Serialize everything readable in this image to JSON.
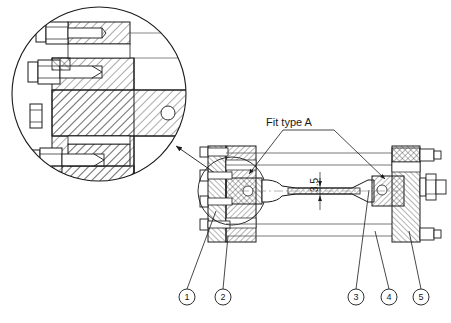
{
  "drawing": {
    "title": "Tensile test specimen assembly with clamping flanges — sectional view",
    "background_color": "#ffffff",
    "line_color": "#1a1a1a",
    "hatch_color": "#333333",
    "thin_line_color": "#555555"
  },
  "annotations": {
    "fit_note": "Fit type A",
    "dimension_thickness": "3.5"
  },
  "detail_view": {
    "name": "enlarged-detail-circle",
    "description": "Enlarged sectional detail of left clamping flange, bolts and specimen grip",
    "circle": {
      "cx": 99,
      "cy": 94,
      "r": 88
    },
    "pointer_target": {
      "x": 222,
      "y": 178
    }
  },
  "balloons": [
    {
      "id": "1",
      "cx": 187,
      "cy": 297,
      "r": 8,
      "leader_to": {
        "x": 216,
        "y": 211
      }
    },
    {
      "id": "2",
      "cx": 223,
      "cy": 297,
      "r": 8,
      "leader_to": {
        "x": 228,
        "y": 236
      }
    },
    {
      "id": "3",
      "cx": 356,
      "cy": 297,
      "r": 8,
      "leader_to": {
        "x": 369,
        "y": 190
      }
    },
    {
      "id": "4",
      "cx": 389,
      "cy": 297,
      "r": 8,
      "leader_to": {
        "x": 375,
        "y": 231
      }
    },
    {
      "id": "5",
      "cx": 421,
      "cy": 297,
      "r": 8,
      "leader_to": {
        "x": 409,
        "y": 231
      }
    }
  ],
  "parts_legend": {
    "1": "left clamping flange",
    "2": "left grip block",
    "3": "right grip block",
    "4": "tie rod nut",
    "5": "right clamping flange"
  }
}
